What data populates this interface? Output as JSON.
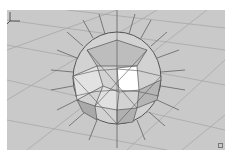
{
  "viewport": {
    "name": "Perspective viewport",
    "background": "#c9c9c9",
    "grid_color": "#a8a8a8",
    "object": {
      "type": "geosphere",
      "show_normals": true,
      "face_color_light": "#e8e8e8",
      "face_color_dark": "#a9a9a9",
      "selected_face_color": "#ffffff",
      "edge_color": "#555555",
      "normal_color": "#6e6e6e"
    },
    "axis_gizmo": {
      "icon": "axis-tripod-icon"
    },
    "corner_marker": {
      "icon": "resize-corner-icon"
    }
  }
}
